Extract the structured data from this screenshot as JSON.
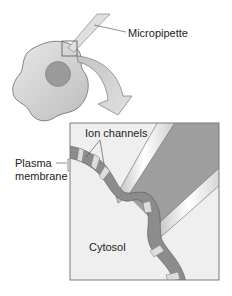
{
  "labels": {
    "micropipette": "Micropipette",
    "ion_channels": "Ion channels",
    "plasma_line1": "Plasma",
    "plasma_line2": "membrane",
    "cytosol": "Cytosol"
  },
  "colors": {
    "cell_fill": "#c9c9c9",
    "cell_stroke": "#6a6a6a",
    "nucleus_fill": "#9a9a9a",
    "membrane_fill": "#8c8c8c",
    "channel_fill": "#dcdcdc",
    "pipette_interior": "#9e9e9e",
    "pipette_glass": "#e2e2e2",
    "inset_bg": "#efefef",
    "inset_border": "#7a7a7a",
    "arrow_fill": "#d2d2d2",
    "text": "#222222"
  }
}
